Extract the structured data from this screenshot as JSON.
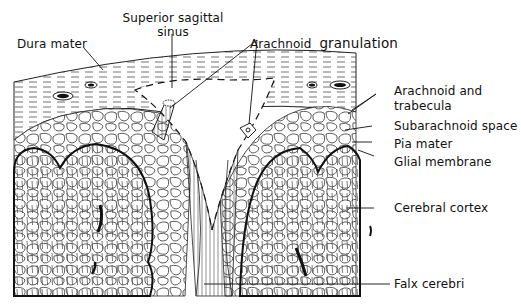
{
  "figure": {
    "labels": {
      "dura_mater": "Dura mater",
      "superior_sagittal_sinus_line1": "Superior sagittal",
      "superior_sagittal_sinus_line2": "sinus",
      "arachnoid_granulation": "Arachnoid",
      "arachnoid_granulation_word2": "granulation",
      "arachnoid_trabecula_line1": "Arachnoid and",
      "arachnoid_trabecula_line2": "trabecula",
      "subarachnoid_space": "Subarachnoid space",
      "pia_mater": "Pia mater",
      "glial_membrane": "Glial membrane",
      "cerebral_cortex": "Cerebral cortex",
      "falx_cerebri": "Falx cerebri"
    },
    "colors": {
      "ink": "#111111",
      "background": "#ffffff"
    }
  }
}
